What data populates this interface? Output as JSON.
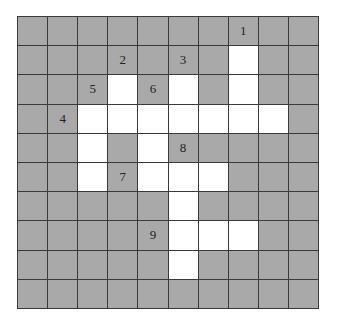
{
  "puzzle": {
    "rows": 10,
    "cols": 10,
    "colors": {
      "blocked": "#a9a9a9",
      "open": "#ffffff",
      "grid_line": "#3a3a3a",
      "number": "#222222"
    },
    "open_cells": [
      [
        1,
        7
      ],
      [
        2,
        3
      ],
      [
        2,
        5
      ],
      [
        2,
        7
      ],
      [
        3,
        2
      ],
      [
        3,
        3
      ],
      [
        3,
        4
      ],
      [
        3,
        5
      ],
      [
        3,
        6
      ],
      [
        3,
        7
      ],
      [
        3,
        8
      ],
      [
        4,
        2
      ],
      [
        4,
        4
      ],
      [
        5,
        2
      ],
      [
        5,
        4
      ],
      [
        5,
        5
      ],
      [
        5,
        6
      ],
      [
        6,
        5
      ],
      [
        7,
        5
      ],
      [
        7,
        6
      ],
      [
        7,
        7
      ],
      [
        8,
        5
      ]
    ],
    "clue_numbers": [
      {
        "label": "1",
        "row": 0,
        "col": 7
      },
      {
        "label": "2",
        "row": 1,
        "col": 3
      },
      {
        "label": "3",
        "row": 1,
        "col": 5
      },
      {
        "label": "4",
        "row": 3,
        "col": 1
      },
      {
        "label": "5",
        "row": 2,
        "col": 2
      },
      {
        "label": "6",
        "row": 2,
        "col": 4
      },
      {
        "label": "7",
        "row": 5,
        "col": 3
      },
      {
        "label": "8",
        "row": 4,
        "col": 5
      },
      {
        "label": "9",
        "row": 7,
        "col": 4
      }
    ]
  }
}
